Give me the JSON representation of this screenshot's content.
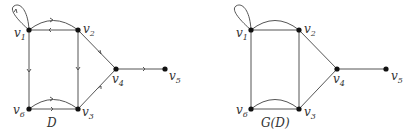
{
  "diagrams": [
    {
      "caption": "D",
      "directed": true,
      "nodes": [
        {
          "id": "v1",
          "label": "v",
          "sub": "1"
        },
        {
          "id": "v2",
          "label": "v",
          "sub": "2"
        },
        {
          "id": "v3",
          "label": "v",
          "sub": "3"
        },
        {
          "id": "v4",
          "label": "v",
          "sub": "4"
        },
        {
          "id": "v5",
          "label": "v",
          "sub": "5"
        },
        {
          "id": "v6",
          "label": "v",
          "sub": "6"
        }
      ],
      "edges": [
        {
          "from": "v1",
          "to": "v1",
          "type": "loop"
        },
        {
          "from": "v1",
          "to": "v2",
          "type": "curved"
        },
        {
          "from": "v2",
          "to": "v1",
          "type": "straight"
        },
        {
          "from": "v1",
          "to": "v6",
          "type": "straight"
        },
        {
          "from": "v2",
          "to": "v3",
          "type": "straight"
        },
        {
          "from": "v2",
          "to": "v4",
          "type": "straight"
        },
        {
          "from": "v3",
          "to": "v4",
          "type": "straight"
        },
        {
          "from": "v4",
          "to": "v5",
          "type": "straight"
        },
        {
          "from": "v6",
          "to": "v3",
          "type": "curved"
        },
        {
          "from": "v6",
          "to": "v3",
          "type": "straight"
        }
      ]
    },
    {
      "caption": "G(D)",
      "directed": false,
      "nodes": [
        {
          "id": "v1",
          "label": "v",
          "sub": "1"
        },
        {
          "id": "v2",
          "label": "v",
          "sub": "2"
        },
        {
          "id": "v3",
          "label": "v",
          "sub": "3"
        },
        {
          "id": "v4",
          "label": "v",
          "sub": "4"
        },
        {
          "id": "v5",
          "label": "v",
          "sub": "5"
        },
        {
          "id": "v6",
          "label": "v",
          "sub": "6"
        }
      ],
      "edges": [
        {
          "from": "v1",
          "to": "v1",
          "type": "loop"
        },
        {
          "from": "v1",
          "to": "v2",
          "type": "curved"
        },
        {
          "from": "v1",
          "to": "v2",
          "type": "straight"
        },
        {
          "from": "v1",
          "to": "v6",
          "type": "straight"
        },
        {
          "from": "v2",
          "to": "v3",
          "type": "straight"
        },
        {
          "from": "v2",
          "to": "v4",
          "type": "straight"
        },
        {
          "from": "v3",
          "to": "v4",
          "type": "straight"
        },
        {
          "from": "v4",
          "to": "v5",
          "type": "straight"
        },
        {
          "from": "v6",
          "to": "v3",
          "type": "curved"
        },
        {
          "from": "v6",
          "to": "v3",
          "type": "straight"
        }
      ]
    }
  ]
}
